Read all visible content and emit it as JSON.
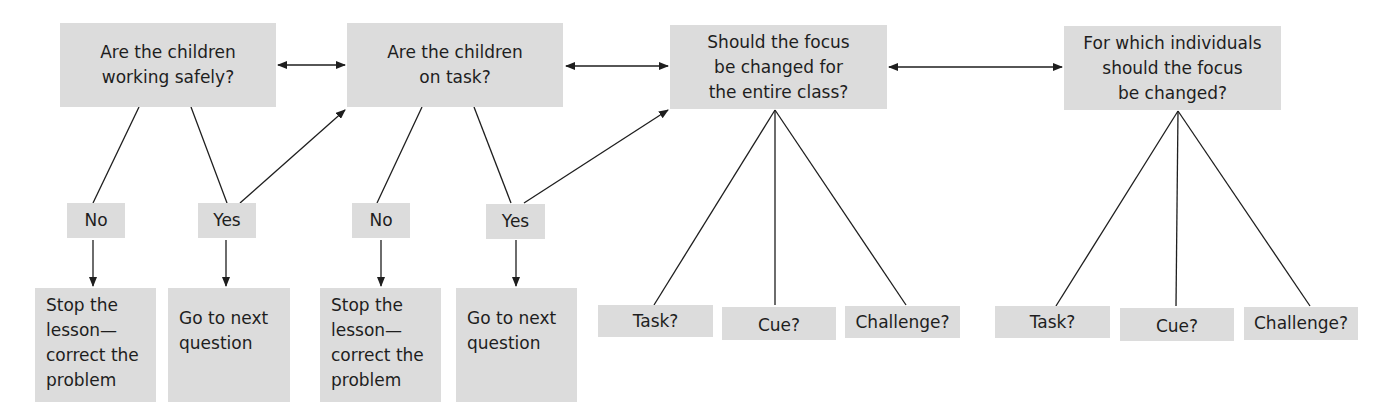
{
  "questions": [
    {
      "label": "Are the children\nworking safely?"
    },
    {
      "label": "Are the children\non task?"
    },
    {
      "label": "Should the focus\nbe changed for\nthe entire class?"
    },
    {
      "label": "For which individuals\nshould the focus\nbe changed?"
    }
  ],
  "answers": [
    {
      "label": "No"
    },
    {
      "label": "Yes"
    },
    {
      "label": "No"
    },
    {
      "label": "Yes"
    }
  ],
  "outcomes": [
    {
      "label": "Stop the\nlesson—\ncorrect the\nproblem"
    },
    {
      "label": "Go to next\nquestion"
    },
    {
      "label": "Stop the\nlesson—\ncorrect the\nproblem"
    },
    {
      "label": "Go to next\nquestion"
    }
  ],
  "class_options": [
    {
      "label": "Task?"
    },
    {
      "label": "Cue?"
    },
    {
      "label": "Challenge?"
    }
  ],
  "individual_options": [
    {
      "label": "Task?"
    },
    {
      "label": "Cue?"
    },
    {
      "label": "Challenge?"
    }
  ],
  "colors": {
    "box_fill": "#dcdcdc",
    "line": "#1e1e1e",
    "background": "#ffffff"
  }
}
